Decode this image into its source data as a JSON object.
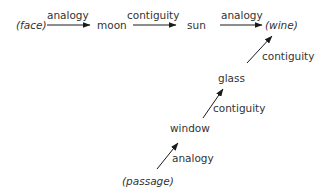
{
  "diagram": {
    "nodes": {
      "face": "(face)",
      "moon": "moon",
      "sun": "sun",
      "wine": "(wine)",
      "glass": "glass",
      "window": "window",
      "passage": "(passage)"
    },
    "edges": [
      {
        "from": "face",
        "to": "moon",
        "label": "analogy"
      },
      {
        "from": "moon",
        "to": "sun",
        "label": "contiguity"
      },
      {
        "from": "sun",
        "to": "wine",
        "label": "analogy"
      },
      {
        "from": "glass",
        "to": "wine",
        "label": "contiguity"
      },
      {
        "from": "window",
        "to": "glass",
        "label": "contiguity"
      },
      {
        "from": "passage",
        "to": "window",
        "label": "analogy"
      }
    ],
    "line_color": "#1a1a1a"
  }
}
